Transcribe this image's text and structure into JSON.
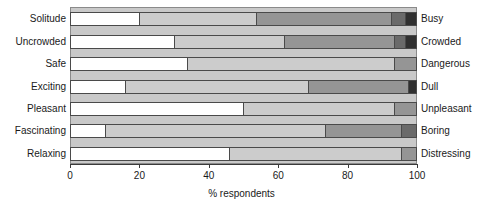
{
  "chart_data": {
    "type": "bar",
    "orientation": "horizontal",
    "stacked": true,
    "normalized_percent": true,
    "title": "",
    "xlabel": "% respondents",
    "ylabel": "",
    "xlim": [
      0,
      100
    ],
    "xticks": [
      0,
      20,
      40,
      60,
      80,
      100
    ],
    "xtick_labels": [
      "0",
      "20",
      "40",
      "60",
      "80",
      "100"
    ],
    "grid": false,
    "legend": "none",
    "categories": [
      "Solitude",
      "Uncrowded",
      "Safe",
      "Exciting",
      "Pleasant",
      "Fascinating",
      "Relaxing"
    ],
    "opposite_categories": [
      "Busy",
      "Crowded",
      "Dangerous",
      "Dull",
      "Unpleasant",
      "Boring",
      "Distressing"
    ],
    "series": [
      {
        "name": "1",
        "color": "#ffffff",
        "values": [
          20,
          30,
          34,
          16,
          50,
          10,
          46
        ]
      },
      {
        "name": "2",
        "color": "#cccccc",
        "values": [
          34,
          32,
          60,
          53,
          44,
          64,
          50
        ]
      },
      {
        "name": "3",
        "color": "#959595",
        "values": [
          39,
          32,
          6,
          29,
          6,
          22,
          4
        ]
      },
      {
        "name": "4",
        "color": "#6a6a6a",
        "values": [
          4,
          3,
          0,
          2,
          0,
          4,
          0
        ]
      },
      {
        "name": "5",
        "color": "#303030",
        "values": [
          3,
          3,
          0,
          0,
          0,
          0,
          0
        ]
      }
    ],
    "rows": [
      {
        "left_label": "Solitude",
        "right_label": "Busy",
        "segments": [
          {
            "value": 20,
            "color": "#ffffff"
          },
          {
            "value": 34,
            "color": "#cccccc"
          },
          {
            "value": 39,
            "color": "#959595"
          },
          {
            "value": 4,
            "color": "#6a6a6a"
          },
          {
            "value": 3,
            "color": "#303030"
          }
        ]
      },
      {
        "left_label": "Uncrowded",
        "right_label": "Crowded",
        "segments": [
          {
            "value": 30,
            "color": "#ffffff"
          },
          {
            "value": 32,
            "color": "#cccccc"
          },
          {
            "value": 32,
            "color": "#959595"
          },
          {
            "value": 3,
            "color": "#6a6a6a"
          },
          {
            "value": 3,
            "color": "#303030"
          }
        ]
      },
      {
        "left_label": "Safe",
        "right_label": "Dangerous",
        "segments": [
          {
            "value": 34,
            "color": "#ffffff"
          },
          {
            "value": 60,
            "color": "#cccccc"
          },
          {
            "value": 6,
            "color": "#959595"
          }
        ]
      },
      {
        "left_label": "Exciting",
        "right_label": "Dull",
        "segments": [
          {
            "value": 16,
            "color": "#ffffff"
          },
          {
            "value": 53,
            "color": "#cccccc"
          },
          {
            "value": 29,
            "color": "#959595"
          },
          {
            "value": 2,
            "color": "#303030"
          }
        ]
      },
      {
        "left_label": "Pleasant",
        "right_label": "Unpleasant",
        "segments": [
          {
            "value": 50,
            "color": "#ffffff"
          },
          {
            "value": 44,
            "color": "#cccccc"
          },
          {
            "value": 6,
            "color": "#959595"
          }
        ]
      },
      {
        "left_label": "Fascinating",
        "right_label": "Boring",
        "segments": [
          {
            "value": 10,
            "color": "#ffffff"
          },
          {
            "value": 64,
            "color": "#cccccc"
          },
          {
            "value": 22,
            "color": "#959595"
          },
          {
            "value": 4,
            "color": "#6a6a6a"
          }
        ]
      },
      {
        "left_label": "Relaxing",
        "right_label": "Distressing",
        "segments": [
          {
            "value": 46,
            "color": "#ffffff"
          },
          {
            "value": 50,
            "color": "#cccccc"
          },
          {
            "value": 4,
            "color": "#959595"
          }
        ]
      }
    ]
  },
  "style": {
    "plot_background": "#c9c9c9",
    "axis_color": "#3a3a3a",
    "bar_outline": "#4a4a4a",
    "text_color": "#1a1a1a"
  }
}
